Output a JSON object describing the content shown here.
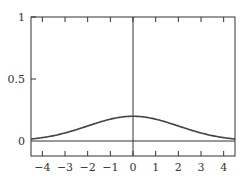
{
  "chart_data": {
    "type": "line",
    "title": "",
    "xlabel": "",
    "ylabel": "",
    "xlim": [
      -4.5,
      4.5
    ],
    "ylim": [
      -0.1,
      1
    ],
    "grid": false,
    "x_ticks": [
      -4,
      -3,
      -2,
      -1,
      0,
      1,
      2,
      3,
      4
    ],
    "x_tick_labels": [
      "−4",
      "−3",
      "−2",
      "−1",
      "0",
      "1",
      "2",
      "3",
      "4"
    ],
    "y_ticks": [
      0,
      0.5,
      1
    ],
    "y_tick_labels": [
      "0",
      "0.5",
      "1"
    ],
    "reference_lines": {
      "horizontal_y": 0,
      "vertical_x": 0
    },
    "series": [
      {
        "name": "normal density (mean 0, sd 2)",
        "x": [
          -4.5,
          -4,
          -3.5,
          -3,
          -2.5,
          -2,
          -1.5,
          -1,
          -0.5,
          0,
          0.5,
          1,
          1.5,
          2,
          2.5,
          3,
          3.5,
          4,
          4.5
        ],
        "values": [
          0.016,
          0.027,
          0.043,
          0.065,
          0.091,
          0.121,
          0.151,
          0.176,
          0.193,
          0.199,
          0.193,
          0.176,
          0.151,
          0.121,
          0.091,
          0.065,
          0.043,
          0.027,
          0.016
        ]
      }
    ],
    "colors": {
      "curve": "#444444",
      "axes": "#333333"
    }
  }
}
